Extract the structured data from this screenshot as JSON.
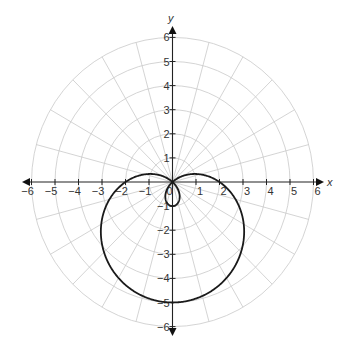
{
  "chart_data": {
    "type": "line",
    "subtype": "polar",
    "title": "",
    "equation": "r = 2 - 3 sin(θ)",
    "curve_name": "limaçon with inner loop",
    "xlabel": "x",
    "ylabel": "y",
    "xlim": [
      -6,
      6
    ],
    "ylim": [
      -6,
      6
    ],
    "x_ticks": [
      -6,
      -5,
      -4,
      -3,
      -2,
      -1,
      0,
      1,
      2,
      3,
      4,
      5,
      6
    ],
    "y_ticks": [
      -6,
      -5,
      -4,
      -3,
      -2,
      -1,
      1,
      2,
      3,
      4,
      5,
      6
    ],
    "x_tick_labels": [
      "−6",
      "−5",
      "−4",
      "−3",
      "−2",
      "−1",
      "0",
      "1",
      "2",
      "3",
      "4",
      "5",
      "6"
    ],
    "y_tick_labels": [
      "−6",
      "−5",
      "−4",
      "−3",
      "−2",
      "−1",
      "1",
      "2",
      "3",
      "4",
      "5",
      "6"
    ],
    "grid": {
      "type": "polar",
      "circle_radii": [
        1,
        2,
        3,
        4,
        5,
        6
      ],
      "radial_step_degrees": 15
    },
    "series": [
      {
        "name": "r = 2 - 3sin(θ)",
        "a": 2,
        "b": -3,
        "key_points": [
          {
            "x": 0,
            "y": -5,
            "note": "outer loop bottom, θ=270°"
          },
          {
            "x": 2,
            "y": 0,
            "note": "θ=0°"
          },
          {
            "x": -2,
            "y": 0,
            "note": "θ=180°"
          },
          {
            "x": 0,
            "y": -1,
            "note": "inner loop bottom, θ=90° (r=-1)"
          },
          {
            "x": 0,
            "y": 0,
            "note": "pole crossing"
          },
          {
            "x": 3.0,
            "y": -2.0,
            "note": "approx right extreme"
          },
          {
            "x": -3.0,
            "y": -2.0,
            "note": "approx left extreme"
          }
        ]
      }
    ],
    "colors": {
      "curve": "#1a1a1a",
      "grid": "#c9c9c9",
      "axis": "#222222"
    }
  }
}
